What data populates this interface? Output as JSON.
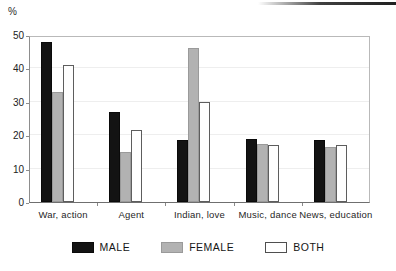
{
  "chart_data": {
    "type": "bar",
    "title": "",
    "subtitle": "",
    "xlabel": "",
    "ylabel": "%",
    "ylim": [
      0,
      50
    ],
    "yticks": [
      0,
      10,
      20,
      30,
      40,
      50
    ],
    "ytick_labels": [
      "0",
      "10",
      "20",
      "30",
      "40",
      "50"
    ],
    "grid": true,
    "legend_position": "bottom",
    "categories": [
      "War, action",
      "Agent",
      "Indian, love",
      "Music, dance",
      "News, education"
    ],
    "series": [
      {
        "name": "MALE",
        "color": "#131313",
        "values": [
          48,
          27,
          18.5,
          19,
          18.5
        ]
      },
      {
        "name": "FEMALE",
        "color": "#b2b2b2",
        "values": [
          33,
          15,
          46,
          17.5,
          16.5
        ]
      },
      {
        "name": "BOTH",
        "color": "#ffffff",
        "values": [
          41,
          21.5,
          30,
          17,
          17
        ]
      }
    ]
  },
  "axis": {
    "unit_label": "%"
  },
  "legend": {
    "items": [
      {
        "label": "MALE",
        "swatch": "male"
      },
      {
        "label": "FEMALE",
        "swatch": "female"
      },
      {
        "label": "BOTH",
        "swatch": "both"
      }
    ]
  }
}
